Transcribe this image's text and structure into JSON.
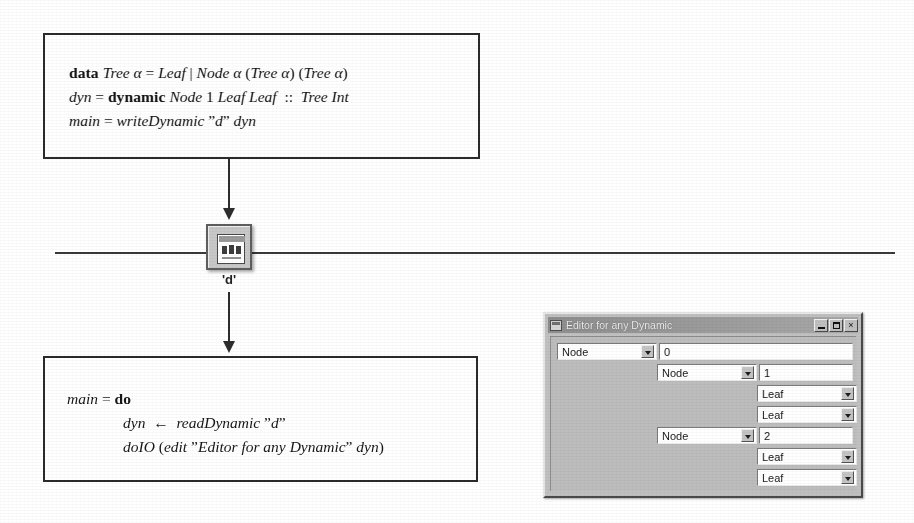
{
  "figure": {
    "top_code_box": {
      "lines": [
        {
          "parts": [
            {
              "t": "data ",
              "s": "kw"
            },
            {
              "t": "Tree ",
              "s": "id"
            },
            {
              "t": "α",
              "s": "id"
            },
            {
              "t": " = ",
              "s": "op"
            },
            {
              "t": "Leaf",
              "s": "id"
            },
            {
              "t": " | ",
              "s": "op"
            },
            {
              "t": "Node ",
              "s": "id"
            },
            {
              "t": "α",
              "s": "id"
            },
            {
              "t": " (",
              "s": "op"
            },
            {
              "t": "Tree ",
              "s": "id"
            },
            {
              "t": "α",
              "s": "id"
            },
            {
              "t": ") (",
              "s": "op"
            },
            {
              "t": "Tree ",
              "s": "id"
            },
            {
              "t": "α",
              "s": "id"
            },
            {
              "t": ")",
              "s": "op"
            }
          ],
          "plain": "data Tree α = Leaf | Node α (Tree α) (Tree α)"
        },
        {
          "parts": [
            {
              "t": "dyn",
              "s": "id"
            },
            {
              "t": " = ",
              "s": "op"
            },
            {
              "t": "dynamic ",
              "s": "kw"
            },
            {
              "t": "Node ",
              "s": "id"
            },
            {
              "t": "1",
              "s": "num"
            },
            {
              "t": " ",
              "s": "op"
            },
            {
              "t": "Leaf Leaf",
              "s": "id"
            },
            {
              "t": "  ::  ",
              "s": "op"
            },
            {
              "t": "Tree Int",
              "s": "id"
            }
          ],
          "plain": "dyn = dynamic Node 1 Leaf Leaf :: Tree Int"
        },
        {
          "parts": [
            {
              "t": "main",
              "s": "id"
            },
            {
              "t": " = ",
              "s": "op"
            },
            {
              "t": "writeDynamic",
              "s": "id"
            },
            {
              "t": " ”",
              "s": "op"
            },
            {
              "t": "d",
              "s": "id"
            },
            {
              "t": "” ",
              "s": "op"
            },
            {
              "t": "dyn",
              "s": "id"
            }
          ],
          "plain": "main = writeDynamic ”d” dyn"
        }
      ]
    },
    "bottom_code_box": {
      "lines": [
        {
          "indent": 0,
          "parts": [
            {
              "t": "main",
              "s": "id"
            },
            {
              "t": " = ",
              "s": "op"
            },
            {
              "t": "do",
              "s": "kw"
            }
          ],
          "plain": "main = do"
        },
        {
          "indent": 1,
          "parts": [
            {
              "t": "dyn",
              "s": "id"
            },
            {
              "t": "  ←  ",
              "s": "op"
            },
            {
              "t": "readDynamic",
              "s": "id"
            },
            {
              "t": " ”",
              "s": "op"
            },
            {
              "t": "d",
              "s": "id"
            },
            {
              "t": "”",
              "s": "op"
            }
          ],
          "plain": "dyn ← readDynamic ”d”"
        },
        {
          "indent": 1,
          "parts": [
            {
              "t": "doIO",
              "s": "id"
            },
            {
              "t": " (",
              "s": "op"
            },
            {
              "t": "edit",
              "s": "id"
            },
            {
              "t": " ”",
              "s": "op"
            },
            {
              "t": "Editor for any Dynamic",
              "s": "id"
            },
            {
              "t": "” ",
              "s": "op"
            },
            {
              "t": "dyn",
              "s": "id"
            },
            {
              "t": ")",
              "s": "op"
            }
          ],
          "plain": "doIO (edit ”Editor for any Dynamic” dyn)"
        }
      ]
    },
    "dynamic_file": {
      "icon_name": "dynamic-file-icon",
      "label": "'d'"
    },
    "persistence_line": {
      "name": "persistent-storage-line"
    },
    "arrows": [
      {
        "name": "arrow-write-dynamic",
        "direction": "down"
      },
      {
        "name": "arrow-read-dynamic",
        "direction": "down"
      }
    ]
  },
  "editor_window": {
    "title": "Editor for any Dynamic",
    "titlebar_buttons": [
      {
        "name": "minimize-button",
        "glyph": "_"
      },
      {
        "name": "maximize-button",
        "glyph": "□"
      },
      {
        "name": "close-button",
        "glyph": "×"
      }
    ],
    "rows": [
      {
        "id": "row-root",
        "depth": 0,
        "combo": "Node",
        "value": "0",
        "has_value": true
      },
      {
        "id": "row-left-node",
        "depth": 1,
        "combo": "Node",
        "value": "1",
        "has_value": true
      },
      {
        "id": "row-left-leaf-1",
        "depth": 2,
        "combo": "Leaf",
        "value": "",
        "has_value": false
      },
      {
        "id": "row-left-leaf-2",
        "depth": 2,
        "combo": "Leaf",
        "value": "",
        "has_value": false
      },
      {
        "id": "row-right-node",
        "depth": 1,
        "combo": "Node",
        "value": "2",
        "has_value": true
      },
      {
        "id": "row-right-leaf-1",
        "depth": 2,
        "combo": "Leaf",
        "value": "",
        "has_value": false
      },
      {
        "id": "row-right-leaf-2",
        "depth": 2,
        "combo": "Leaf",
        "value": "",
        "has_value": false
      }
    ],
    "combo_options": [
      "Leaf",
      "Node"
    ]
  },
  "colors": {
    "ink": "#1b1b1b",
    "paper": "#ffffff",
    "dialog_face": "#c0c0c0",
    "titlebar": "#8e8e8e",
    "field_bg": "#ffffff"
  }
}
